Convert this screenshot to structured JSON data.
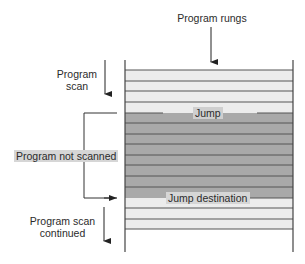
{
  "labels": {
    "program_rungs": "Program rungs",
    "program_scan_line1": "Program",
    "program_scan_line2": "scan",
    "jump": "Jump",
    "program_not_scanned": "Program not scanned",
    "jump_destination": "Jump destination",
    "scan_continued_line1": "Program scan",
    "scan_continued_line2": "continued"
  },
  "ladder": {
    "left_rail_x": 125,
    "right_rail_x": 293,
    "rail_top_y": 60,
    "rail_bottom_y": 252,
    "rung_y": [
      70,
      81,
      91,
      102,
      113,
      123,
      134,
      144,
      155,
      165,
      176,
      187,
      198,
      208,
      219,
      229
    ],
    "skipped_region": {
      "from_y": 113,
      "to_y": 198
    }
  },
  "colors": {
    "scanned_band": "#ececec",
    "skipped_band": "#a9a9a9",
    "rung_line": "#555555",
    "rail_line": "#444444",
    "label_box": "#d6d6d6",
    "arrow": "#222222"
  }
}
